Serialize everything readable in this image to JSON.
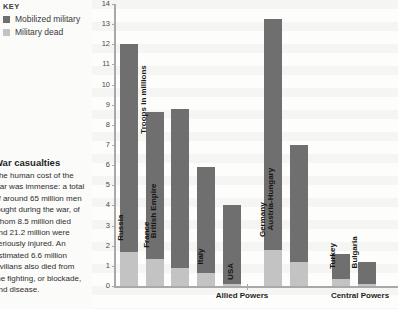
{
  "key": {
    "title": "KEY",
    "entries": [
      {
        "label": "Mobilized military",
        "color": "#6f6f6f",
        "icon": "dark-square-swatch"
      },
      {
        "label": "Military dead",
        "color": "#c3c3c3",
        "icon": "light-square-swatch"
      }
    ]
  },
  "article": {
    "heading": "War casualties",
    "body": "The human cost of the war was immense: a total of around 65 million men fought during the war, of whom 8.5 million died and 21.2 million were seriously injured. An estimated 6.6 million civilians also died from the fighting, or blockade, and disease."
  },
  "chart_data": {
    "type": "bar",
    "title": "",
    "xlabel": "",
    "ylabel": "Troops in millions",
    "ylim": [
      0,
      14
    ],
    "yticks": [
      0,
      1,
      2,
      3,
      4,
      5,
      6,
      7,
      8,
      9,
      10,
      11,
      12,
      13,
      14
    ],
    "grid": false,
    "legend_position": "top-left",
    "categories": [
      "Russia",
      "France",
      "British Empire",
      "Italy",
      "USA",
      "Germany",
      "Austria-Hungary",
      "Turkey",
      "Bulgaria"
    ],
    "groups": [
      {
        "label": "Allied Powers",
        "categories": [
          "Russia",
          "France",
          "British Empire",
          "Italy",
          "USA"
        ]
      },
      {
        "label": "Central Powers",
        "categories": [
          "Germany",
          "Austria-Hungary",
          "Turkey",
          "Bulgaria"
        ]
      }
    ],
    "series": [
      {
        "name": "Mobilized military",
        "color": "#6f6f6f",
        "values": [
          12.0,
          8.66,
          8.8,
          5.9,
          4.0,
          13.25,
          7.0,
          1.6,
          1.2
        ]
      },
      {
        "name": "Military dead",
        "color": "#c3c3c3",
        "values": [
          1.7,
          1.35,
          0.9,
          0.65,
          0.12,
          1.8,
          1.2,
          0.33,
          0.09
        ]
      }
    ]
  }
}
